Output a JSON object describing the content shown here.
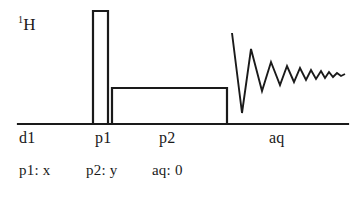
{
  "diagram": {
    "type": "nmr-pulse-sequence",
    "channel": {
      "nucleus_superscript": "1",
      "nucleus_symbol": "H",
      "nucleus_label": "1H"
    },
    "stroke_color": "#1a1a1a",
    "background_color": "#ffffff",
    "timeline": {
      "baseline_label": "time-axis"
    },
    "events": [
      {
        "id": "d1",
        "label": "d1",
        "kind": "delay"
      },
      {
        "id": "p1",
        "label": "p1",
        "kind": "pulse"
      },
      {
        "id": "p2",
        "label": "p2",
        "kind": "pulse"
      },
      {
        "id": "aq",
        "label": "aq",
        "kind": "acquisition"
      }
    ],
    "phases": {
      "p1": "p1: x",
      "p2": "p2: y",
      "aq": "aq: 0"
    }
  },
  "chart_data": {
    "type": "line",
    "xlabel": "time",
    "ylabel": "amplitude",
    "grid": false,
    "legend": null,
    "xlim": [
      18,
      348
    ],
    "ylim": [
      124,
      11
    ],
    "series": [
      {
        "name": "baseline",
        "x": [
          18,
          348
        ],
        "y": [
          124,
          124
        ]
      },
      {
        "name": "p1-pulse",
        "note": "tall narrow rectangle, hard 90 degree pulse",
        "x": [
          93,
          93,
          108,
          108
        ],
        "y": [
          124,
          11,
          11,
          124
        ]
      },
      {
        "name": "p2-pulse",
        "note": "long low rectangle, spin-lock / low power pulse",
        "x": [
          112,
          112,
          227,
          227
        ],
        "y": [
          124,
          88,
          88,
          124
        ]
      },
      {
        "name": "fid",
        "note": "damped oscillating free induction decay during acquisition",
        "x": [
          232,
          242,
          251,
          262,
          271,
          280,
          287,
          294,
          300,
          306,
          311,
          316,
          321,
          325,
          329,
          333,
          337,
          341,
          345
        ],
        "y": [
          33,
          113,
          49,
          91,
          62,
          85,
          66,
          82,
          68,
          80,
          70,
          79,
          71,
          78,
          72,
          77,
          73,
          76,
          74
        ]
      }
    ]
  }
}
